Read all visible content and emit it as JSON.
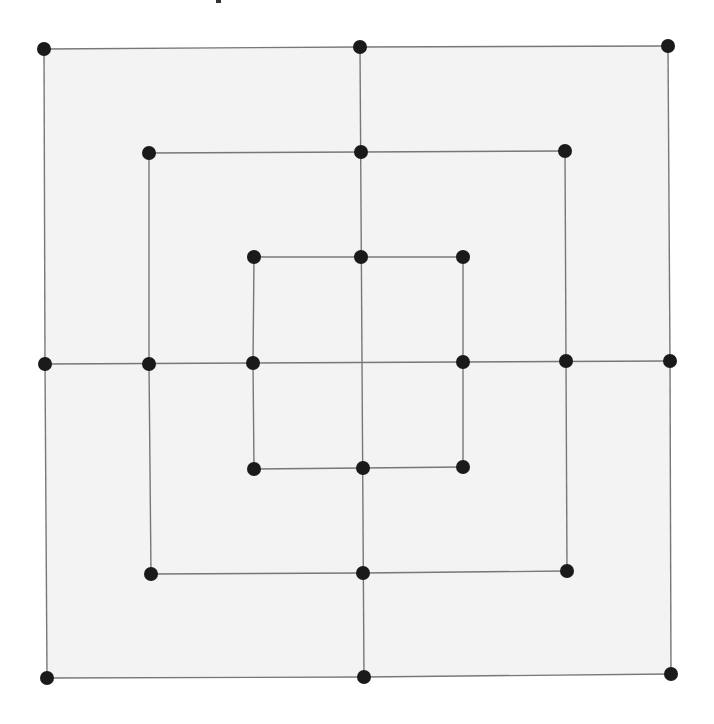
{
  "title": "",
  "board": {
    "type": "nine-mens-morris",
    "fill_color": "#f3f3f3",
    "line_color": "#777777",
    "point_color": "#1a1a1a",
    "point_radius": 7,
    "outer_square_fill": [
      [
        44,
        49
      ],
      [
        668,
        46
      ],
      [
        671,
        674
      ],
      [
        47,
        678
      ]
    ],
    "rings": [
      {
        "name": "outer",
        "points": [
          [
            44,
            49
          ],
          [
            360,
            47
          ],
          [
            668,
            46
          ],
          [
            670,
            361
          ],
          [
            671,
            674
          ],
          [
            364,
            677
          ],
          [
            47,
            678
          ],
          [
            45,
            364
          ]
        ]
      },
      {
        "name": "middle",
        "points": [
          [
            149,
            153
          ],
          [
            361,
            152
          ],
          [
            565,
            151
          ],
          [
            566,
            361
          ],
          [
            567,
            571
          ],
          [
            363,
            573
          ],
          [
            151,
            574
          ],
          [
            149,
            364
          ]
        ]
      },
      {
        "name": "inner",
        "points": [
          [
            254,
            257
          ],
          [
            361,
            257
          ],
          [
            463,
            257
          ],
          [
            463,
            362
          ],
          [
            463,
            467
          ],
          [
            363,
            468
          ],
          [
            254,
            469
          ],
          [
            253,
            363
          ]
        ]
      }
    ],
    "cross_lines": [
      {
        "name": "vertical-midline",
        "from": [
          360,
          47
        ],
        "to": [
          364,
          677
        ]
      },
      {
        "name": "horizontal-midline",
        "from": [
          45,
          364
        ],
        "to": [
          670,
          361
        ]
      }
    ],
    "point_count": 24
  }
}
